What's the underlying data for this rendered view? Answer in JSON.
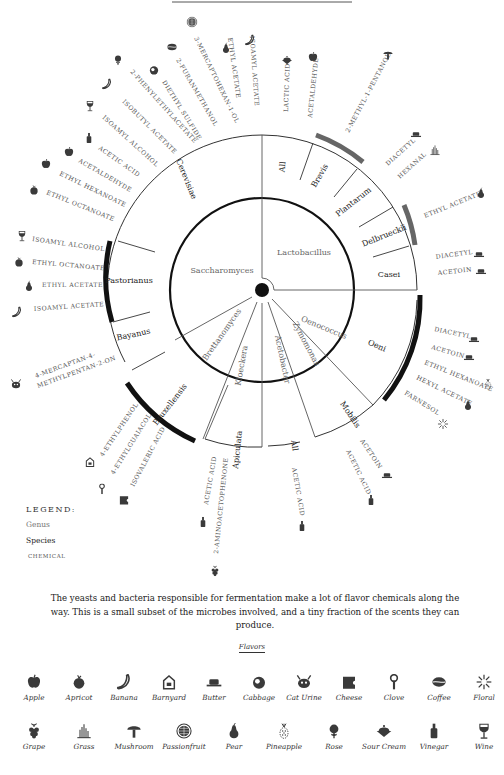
{
  "chart_data": {
    "type": "radial-tree",
    "center": [
      262,
      290
    ],
    "genera": [
      {
        "name": "Saccharomyces",
        "kingdom": "yeast",
        "species": [
          {
            "name": "Cerevisiae",
            "chemicals": [
              "Ethyl octanoate",
              "Ethyl hexanoate",
              "Acetaldehyde",
              "Acetic acid",
              "Isoamyl alcohol",
              "Isobutyl acetate",
              "2-Phenylethylacetate",
              "Diethyl sulfide",
              "2-Furanmethanol",
              "3-Mercaptohexan-1-ol",
              "Ethyl acetate",
              "Isoamyl acetate"
            ]
          },
          {
            "name": "Pastorianus",
            "chemicals": [
              "Isoamyl alcohol",
              "Ethyl octanoate",
              "Ethyl acetate",
              "Isoamyl acetate"
            ]
          },
          {
            "name": "Bayanus",
            "chemicals": [
              "4-Mercaptan-4-methylpentan-2-on"
            ]
          }
        ]
      },
      {
        "name": "Brettanomyces",
        "kingdom": "yeast",
        "species": [
          {
            "name": "Bruxellensis",
            "chemicals": [
              "4-Ethylphenol",
              "4-Ethylguaiacol",
              "Isovaleric acid"
            ]
          }
        ]
      },
      {
        "name": "Kloeckera",
        "kingdom": "yeast",
        "species": [
          {
            "name": "Apiculata",
            "chemicals": [
              "Acetic acid",
              "2-Aminoacetophenone"
            ]
          }
        ]
      },
      {
        "name": "Acetobacter",
        "kingdom": "bacteria",
        "species": [
          {
            "name": "All",
            "chemicals": [
              "Acetic acid"
            ]
          }
        ]
      },
      {
        "name": "Zymomonas",
        "kingdom": "bacteria",
        "species": [
          {
            "name": "Mobilis",
            "chemicals": [
              "Acetoin",
              "Acetic acid"
            ]
          }
        ]
      },
      {
        "name": "Oenococcus",
        "kingdom": "bacteria",
        "species": [
          {
            "name": "Oeni",
            "chemicals": [
              "Diacetyl",
              "Acetoin",
              "Ethyl hexanoate",
              "Hexyl acetate",
              "Farnesol"
            ]
          }
        ]
      },
      {
        "name": "Lactobacillus",
        "kingdom": "bacteria",
        "species": [
          {
            "name": "All",
            "chemicals": [
              "Lactic acid",
              "Acetaldehyde"
            ]
          },
          {
            "name": "Brevis",
            "chemicals": [
              "2-Methyl-1-pentanol"
            ]
          },
          {
            "name": "Plantarum",
            "chemicals": [
              "Diacetyl",
              "Hexanal"
            ]
          },
          {
            "name": "Delbrueckii",
            "chemicals": [
              "Ethyl acetate"
            ]
          },
          {
            "name": "Casei",
            "chemicals": [
              "Diacetyl",
              "Acetoin"
            ]
          }
        ]
      }
    ],
    "legend": [
      "Genus",
      "Species",
      "Chemical"
    ]
  },
  "diagram": {
    "genus_labels": [
      {
        "text": "Saccharomyces",
        "x": 222,
        "y": 273,
        "rot": 0
      },
      {
        "text": "Lactobacillus",
        "x": 304,
        "y": 255,
        "rot": 0
      },
      {
        "text": "Oenococcus",
        "x": 323,
        "y": 330,
        "rot": 22
      },
      {
        "text": "Zymomonas",
        "x": 304,
        "y": 345,
        "rot": 62
      },
      {
        "text": "Acetobacter",
        "x": 280,
        "y": 360,
        "rot": 78
      },
      {
        "text": "Kloeckera",
        "x": 244,
        "y": 366,
        "rot": -80
      },
      {
        "text": "Brettanomyces",
        "x": 224,
        "y": 336,
        "rot": -55
      }
    ],
    "species_labels": [
      {
        "text": "Cerevisiae",
        "x": 184,
        "y": 180,
        "rot": 68
      },
      {
        "text": "Pastorianus",
        "x": 129,
        "y": 283,
        "rot": 0
      },
      {
        "text": "Bayanus",
        "x": 134,
        "y": 337,
        "rot": -12
      },
      {
        "text": "Bruxellensis",
        "x": 172,
        "y": 406,
        "rot": -52
      },
      {
        "text": "Apiculata",
        "x": 240,
        "y": 450,
        "rot": -84
      },
      {
        "text": "All",
        "x": 292,
        "y": 446,
        "rot": 82
      },
      {
        "text": "Mobilis",
        "x": 348,
        "y": 416,
        "rot": 56
      },
      {
        "text": "Oeni",
        "x": 376,
        "y": 348,
        "rot": 24
      },
      {
        "text": "Casei",
        "x": 389,
        "y": 277,
        "rot": 0
      },
      {
        "text": "Delbrueckii",
        "x": 385,
        "y": 238,
        "rot": -22
      },
      {
        "text": "Plantarum",
        "x": 355,
        "y": 204,
        "rot": -38
      },
      {
        "text": "Brevis",
        "x": 322,
        "y": 177,
        "rot": -60
      },
      {
        "text": "All",
        "x": 285,
        "y": 167,
        "rot": -84
      }
    ],
    "chemicals": [
      {
        "text": "3-Mercaptohexan-1-ol",
        "x": 194,
        "y": 38,
        "rot": 64,
        "icon": "passionfruit",
        "ix": 192,
        "iy": 22
      },
      {
        "text": "2-Furanmethanol",
        "x": 176,
        "y": 60,
        "rot": 60,
        "icon": "coffee",
        "ix": 172,
        "iy": 47
      },
      {
        "text": "Diethyl sulfide",
        "x": 162,
        "y": 82,
        "rot": 58,
        "icon": "cabbage",
        "ix": 154,
        "iy": 70
      },
      {
        "text": "2-Phenylethylacetate",
        "x": 130,
        "y": 72,
        "rot": 48,
        "icon": "rose",
        "ix": 118,
        "iy": 60
      },
      {
        "text": "Isobutyl acetate",
        "x": 122,
        "y": 102,
        "rot": 45,
        "icon": "banana",
        "ix": 107,
        "iy": 84
      },
      {
        "text": "Isoamyl alcohol",
        "x": 102,
        "y": 118,
        "rot": 42,
        "icon": "wine",
        "ix": 90,
        "iy": 106
      },
      {
        "text": "Acetic acid",
        "x": 98,
        "y": 149,
        "rot": 35,
        "icon": "vinegar",
        "ix": 89,
        "iy": 138
      },
      {
        "text": "Acetaldehyde",
        "x": 78,
        "y": 162,
        "rot": 30,
        "icon": "apple",
        "ix": 69,
        "iy": 152
      },
      {
        "text": "Ethyl hexanoate",
        "x": 59,
        "y": 175,
        "rot": 26,
        "icon": "apple",
        "ix": 46,
        "iy": 164
      },
      {
        "text": "Ethyl octanoate",
        "x": 46,
        "y": 194,
        "rot": 22,
        "icon": "apricot",
        "ix": 34,
        "iy": 190
      },
      {
        "text": "Ethyl acetate",
        "x": 228,
        "y": 38,
        "rot": 82,
        "icon": "pear",
        "ix": 226,
        "iy": 48
      },
      {
        "text": "Isoamyl acetate",
        "x": 250,
        "y": 36,
        "rot": 86,
        "icon": "banana",
        "ix": 250,
        "iy": 40
      },
      {
        "text": "Isoamyl alcohol",
        "x": 32,
        "y": 241,
        "rot": 8,
        "icon": "wine",
        "ix": 22,
        "iy": 236
      },
      {
        "text": "Ethyl octanoate",
        "x": 32,
        "y": 264,
        "rot": 5,
        "icon": "apricot",
        "ix": 19,
        "iy": 262
      },
      {
        "text": "Ethyl acetate",
        "x": 42,
        "y": 287,
        "rot": 0,
        "icon": "pear",
        "ix": 29,
        "iy": 286
      },
      {
        "text": "Isoamyl acetate",
        "x": 34,
        "y": 311,
        "rot": -4,
        "icon": "banana",
        "ix": 17,
        "iy": 312
      },
      {
        "text": "4-Mercaptan-4-",
        "x": 36,
        "y": 378,
        "rot": -20,
        "icon": "caturine",
        "ix": 16,
        "iy": 384
      },
      {
        "text": "methylpentan-2-on",
        "x": 38,
        "y": 388,
        "rot": -20,
        "icon": "",
        "ix": 0,
        "iy": 0
      },
      {
        "text": "4-Ethylphenol",
        "x": 103,
        "y": 457,
        "rot": -56,
        "icon": "barnyard",
        "ix": 90,
        "iy": 462
      },
      {
        "text": "4-Ethylguaiacol",
        "x": 114,
        "y": 475,
        "rot": -58,
        "icon": "clove",
        "ix": 102,
        "iy": 489
      },
      {
        "text": "Isovaleric acid",
        "x": 134,
        "y": 487,
        "rot": -62,
        "icon": "cheese",
        "ix": 124,
        "iy": 500
      },
      {
        "text": "Acetic acid",
        "x": 208,
        "y": 505,
        "rot": -80,
        "icon": "vinegar",
        "ix": 203,
        "iy": 522
      },
      {
        "text": "2-Aminoacetophenone",
        "x": 218,
        "y": 554,
        "rot": -84,
        "icon": "grape",
        "ix": 215,
        "iy": 571
      },
      {
        "text": "Acetic acid",
        "x": 292,
        "y": 468,
        "rot": 80,
        "icon": "vinegar",
        "ix": 302,
        "iy": 526
      },
      {
        "text": "Acetoin",
        "x": 360,
        "y": 441,
        "rot": 56,
        "icon": "butter",
        "ix": 387,
        "iy": 475
      },
      {
        "text": "Acetic acid",
        "x": 346,
        "y": 451,
        "rot": 64,
        "icon": "vinegar",
        "ix": 371,
        "iy": 500
      },
      {
        "text": "Diacetyl",
        "x": 434,
        "y": 331,
        "rot": 12,
        "icon": "butter",
        "ix": 474,
        "iy": 339
      },
      {
        "text": "Acetoin",
        "x": 431,
        "y": 349,
        "rot": 16,
        "icon": "butter",
        "ix": 469,
        "iy": 357
      },
      {
        "text": "Ethyl hexanoate",
        "x": 424,
        "y": 364,
        "rot": 22,
        "icon": "pineapple",
        "ix": 488,
        "iy": 384
      },
      {
        "text": "Hexyl acetate",
        "x": 416,
        "y": 379,
        "rot": 26,
        "icon": "pear",
        "ix": 468,
        "iy": 405
      },
      {
        "text": "Farnesol",
        "x": 404,
        "y": 394,
        "rot": 32,
        "icon": "floral",
        "ix": 443,
        "iy": 424
      },
      {
        "text": "Diacetyl",
        "x": 436,
        "y": 259,
        "rot": -8,
        "icon": "butter",
        "ix": 479,
        "iy": 254
      },
      {
        "text": "Acetoin",
        "x": 438,
        "y": 275,
        "rot": -6,
        "icon": "butter",
        "ix": 481,
        "iy": 271
      },
      {
        "text": "Ethyl acetate",
        "x": 425,
        "y": 218,
        "rot": -22,
        "icon": "pear",
        "ix": 481,
        "iy": 193
      },
      {
        "text": "Diacetyl",
        "x": 388,
        "y": 166,
        "rot": -42,
        "icon": "butter",
        "ix": 416,
        "iy": 134
      },
      {
        "text": "Hexanal",
        "x": 400,
        "y": 179,
        "rot": -42,
        "icon": "grass",
        "ix": 435,
        "iy": 150
      },
      {
        "text": "2-Methyl-1-pentanol",
        "x": 349,
        "y": 133,
        "rot": -62,
        "icon": "mushroom",
        "ix": 388,
        "iy": 55
      },
      {
        "text": "Lactic acid",
        "x": 288,
        "y": 112,
        "rot": -88,
        "icon": "sourcream",
        "ix": 287,
        "iy": 60
      },
      {
        "text": "Acetaldehyde",
        "x": 312,
        "y": 118,
        "rot": -84,
        "icon": "apple",
        "ix": 313,
        "iy": 57
      }
    ]
  },
  "legend": {
    "title": "LEGEND:",
    "genus": "Genus",
    "species": "Species",
    "chemical": "CHEMICAL"
  },
  "caption": "The yeasts and bacteria responsible for fermentation make a lot of flavor chemicals along the way. This is a small subset of the microbes involved, and a tiny fraction of the scents they can produce.",
  "flavors": {
    "title": "Flavors",
    "row1": [
      {
        "label": "Apple",
        "icon": "apple"
      },
      {
        "label": "Apricot",
        "icon": "apricot"
      },
      {
        "label": "Banana",
        "icon": "banana"
      },
      {
        "label": "Barnyard",
        "icon": "barnyard"
      },
      {
        "label": "Butter",
        "icon": "butter"
      },
      {
        "label": "Cabbage",
        "icon": "cabbage"
      },
      {
        "label": "Cat Urine",
        "icon": "caturine"
      },
      {
        "label": "Cheese",
        "icon": "cheese"
      },
      {
        "label": "Clove",
        "icon": "clove"
      },
      {
        "label": "Coffee",
        "icon": "coffee"
      },
      {
        "label": "Floral",
        "icon": "floral"
      }
    ],
    "row2": [
      {
        "label": "Grape",
        "icon": "grape"
      },
      {
        "label": "Grass",
        "icon": "grass"
      },
      {
        "label": "Mushroom",
        "icon": "mushroom"
      },
      {
        "label": "Passionfruit",
        "icon": "passionfruit"
      },
      {
        "label": "Pear",
        "icon": "pear"
      },
      {
        "label": "Pineapple",
        "icon": "pineapple"
      },
      {
        "label": "Rose",
        "icon": "rose"
      },
      {
        "label": "Sour Cream",
        "icon": "sourcream"
      },
      {
        "label": "Vinegar",
        "icon": "vinegar"
      },
      {
        "label": "Wine",
        "icon": "wine"
      }
    ]
  },
  "colors": {
    "ink": "#222222",
    "icon": "#444444",
    "bar_black": "#111111",
    "bar_gray": "#666666",
    "line": "#555555"
  }
}
